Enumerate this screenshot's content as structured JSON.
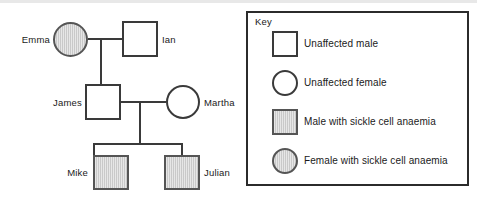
{
  "pedigree": {
    "individuals": [
      {
        "id": "emma",
        "name": "Emma",
        "sex": "female",
        "symbol": "circle",
        "affected": true,
        "generation": 1,
        "label_side": "left"
      },
      {
        "id": "ian",
        "name": "Ian",
        "sex": "male",
        "symbol": "square",
        "affected": false,
        "generation": 1,
        "label_side": "right"
      },
      {
        "id": "james",
        "name": "James",
        "sex": "male",
        "symbol": "square",
        "affected": false,
        "generation": 2,
        "label_side": "left"
      },
      {
        "id": "martha",
        "name": "Martha",
        "sex": "female",
        "symbol": "circle",
        "affected": false,
        "generation": 2,
        "label_side": "right"
      },
      {
        "id": "mike",
        "name": "Mike",
        "sex": "male",
        "symbol": "square",
        "affected": true,
        "generation": 3,
        "label_side": "left"
      },
      {
        "id": "julian",
        "name": "Julian",
        "sex": "male",
        "symbol": "square",
        "affected": true,
        "generation": 3,
        "label_side": "right"
      }
    ],
    "matings": [
      {
        "partners": [
          "emma",
          "ian"
        ],
        "children": [
          "james"
        ]
      },
      {
        "partners": [
          "james",
          "martha"
        ],
        "children": [
          "mike",
          "julian"
        ]
      }
    ]
  },
  "legend": {
    "title": "Key",
    "entries": [
      {
        "symbol": "square",
        "affected": false,
        "label": "Unaffected male"
      },
      {
        "symbol": "circle",
        "affected": false,
        "label": "Unaffected female"
      },
      {
        "symbol": "square",
        "affected": true,
        "label": "Male with sickle cell anaemia"
      },
      {
        "symbol": "circle",
        "affected": true,
        "label": "Female with sickle cell anaemia"
      }
    ]
  },
  "colors": {
    "affected_fill": "#c9c9c9",
    "unaffected_fill": "#ffffff",
    "stroke": "#3a3a3a",
    "legend_border": "#2b2b2b",
    "background": "#ffffff"
  }
}
